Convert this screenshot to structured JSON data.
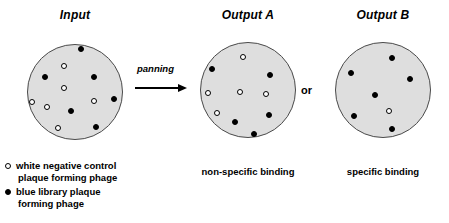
{
  "figure": {
    "panels": [
      {
        "id": "input",
        "title": "Input",
        "caption": "",
        "cx": 75,
        "cy": 92,
        "r": 48,
        "dots": [
          {
            "type": "blue",
            "x": 80,
            "y": 48
          },
          {
            "type": "white",
            "x": 63,
            "y": 65
          },
          {
            "type": "blue",
            "x": 44,
            "y": 76
          },
          {
            "type": "blue",
            "x": 93,
            "y": 76
          },
          {
            "type": "white",
            "x": 63,
            "y": 87
          },
          {
            "type": "white",
            "x": 31,
            "y": 101
          },
          {
            "type": "white",
            "x": 46,
            "y": 106
          },
          {
            "type": "blue",
            "x": 70,
            "y": 110
          },
          {
            "type": "white",
            "x": 93,
            "y": 100
          },
          {
            "type": "blue",
            "x": 113,
            "y": 98
          },
          {
            "type": "white",
            "x": 57,
            "y": 127
          },
          {
            "type": "blue",
            "x": 95,
            "y": 126
          }
        ]
      },
      {
        "id": "output-a",
        "title": "Output A",
        "caption": "non-specific binding",
        "cx": 248,
        "cy": 90,
        "r": 48,
        "dots": [
          {
            "type": "white",
            "x": 242,
            "y": 56
          },
          {
            "type": "blue",
            "x": 211,
            "y": 68
          },
          {
            "type": "blue",
            "x": 269,
            "y": 74
          },
          {
            "type": "white",
            "x": 207,
            "y": 92
          },
          {
            "type": "white",
            "x": 239,
            "y": 91
          },
          {
            "type": "white",
            "x": 265,
            "y": 93
          },
          {
            "type": "white",
            "x": 216,
            "y": 112
          },
          {
            "type": "blue",
            "x": 234,
            "y": 121
          },
          {
            "type": "blue",
            "x": 268,
            "y": 114
          },
          {
            "type": "blue",
            "x": 253,
            "y": 133
          }
        ]
      },
      {
        "id": "output-b",
        "title": "Output B",
        "caption": "specific binding",
        "cx": 383,
        "cy": 90,
        "r": 48,
        "dots": [
          {
            "type": "blue",
            "x": 391,
            "y": 57
          },
          {
            "type": "blue",
            "x": 350,
            "y": 72
          },
          {
            "type": "blue",
            "x": 409,
            "y": 78
          },
          {
            "type": "blue",
            "x": 374,
            "y": 94
          },
          {
            "type": "white",
            "x": 388,
            "y": 110
          },
          {
            "type": "blue",
            "x": 353,
            "y": 115
          },
          {
            "type": "blue",
            "x": 391,
            "y": 128
          }
        ]
      }
    ],
    "arrow": {
      "label": "panning"
    },
    "connector": {
      "label": "or"
    },
    "legend": {
      "entries": [
        {
          "marker": "white",
          "line1": "white negative control",
          "line2": "plaque forming phage"
        },
        {
          "marker": "blue",
          "line1": "blue library plaque",
          "line2": "forming phage"
        }
      ]
    },
    "colors": {
      "dish_fill": "#dedede",
      "dish_stroke": "#4a4a4a",
      "blue_plaque": "#000000",
      "white_plaque": "#ffffff",
      "background": "#ffffff"
    }
  }
}
